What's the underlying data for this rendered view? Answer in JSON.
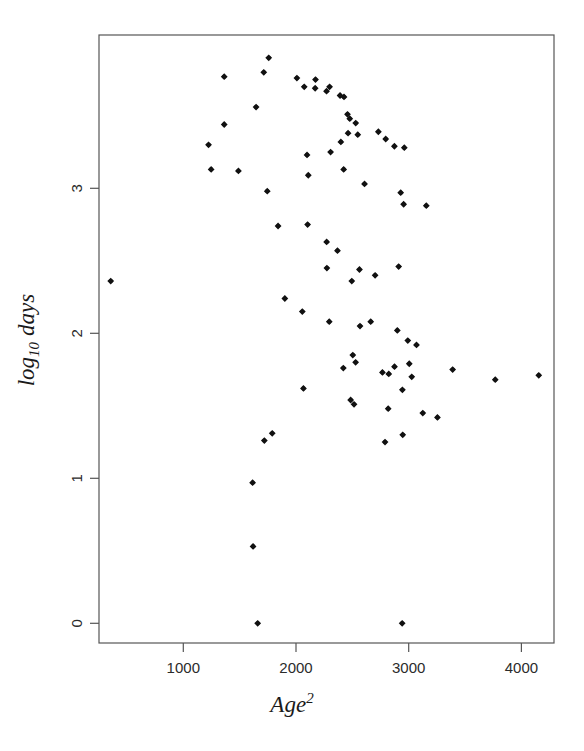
{
  "chart_data": {
    "type": "scatter",
    "title": "",
    "xlabel": "Age^2",
    "ylabel": "log10 days",
    "xlabel_parts": {
      "base": "Age",
      "exponent": "2"
    },
    "ylabel_parts": {
      "base": "log",
      "subscript": "10",
      "tail": "days"
    },
    "xlim": [
      310,
      4230
    ],
    "ylim": [
      -0.17,
      3.72
    ],
    "xticks": [
      1000,
      2000,
      3000,
      4000
    ],
    "xtick_labels": [
      "1000",
      "2000",
      "3000",
      "4000"
    ],
    "yticks": [
      0,
      1,
      2,
      3
    ],
    "ytick_labels": [
      "0",
      "1",
      "2",
      "3"
    ],
    "grid": false,
    "legend": false,
    "marker": "filled-diamond",
    "marker_color": "#111111",
    "frame_color": "#555555",
    "background": "#ffffff",
    "n_points": 79,
    "x": [
      1363,
      1758,
      1714,
      2008,
      2173,
      2298,
      1363,
      1224,
      1489,
      1745,
      1247,
      1646,
      2073,
      2170,
      2271,
      2391,
      2426,
      2457,
      2477,
      2530,
      2462,
      2548,
      2398,
      2307,
      2098,
      2873,
      2731,
      2796,
      2961,
      2608,
      2423,
      2109,
      2929,
      2955,
      3156,
      2103,
      1841,
      2272,
      2368,
      2274,
      2911,
      2563,
      2702,
      2495,
      1901,
      2056,
      2295,
      2568,
      2663,
      2899,
      2992,
      3069,
      2504,
      2529,
      3390,
      3768,
      4154,
      2874,
      3005,
      2420,
      2767,
      2823,
      3027,
      2944,
      2818,
      3125,
      3255,
      2947,
      2790,
      2066,
      2485,
      2515,
      1789,
      1719,
      1615,
      1619,
      1660,
      2942,
      356
    ],
    "y": [
      3.77,
      3.9,
      3.8,
      3.76,
      3.75,
      3.7,
      3.44,
      3.3,
      3.12,
      2.98,
      3.13,
      3.56,
      3.7,
      3.69,
      3.67,
      3.64,
      3.63,
      3.51,
      3.48,
      3.45,
      3.38,
      3.37,
      3.32,
      3.25,
      3.23,
      3.29,
      3.39,
      3.34,
      3.28,
      3.03,
      3.13,
      3.09,
      2.97,
      2.89,
      2.88,
      2.75,
      2.74,
      2.63,
      2.57,
      2.45,
      2.46,
      2.44,
      2.4,
      2.36,
      2.24,
      2.15,
      2.08,
      2.05,
      2.08,
      2.02,
      1.95,
      1.92,
      1.85,
      1.8,
      1.75,
      1.68,
      1.71,
      1.77,
      1.79,
      1.76,
      1.73,
      1.72,
      1.7,
      1.61,
      1.48,
      1.45,
      1.42,
      1.3,
      1.25,
      1.62,
      1.54,
      1.51,
      1.31,
      1.26,
      0.97,
      0.53,
      0.0,
      0.0,
      2.36
    ],
    "points": [
      {
        "x": 1363,
        "y": 3.77
      },
      {
        "x": 1758,
        "y": 3.9
      },
      {
        "x": 1714,
        "y": 3.8
      },
      {
        "x": 2008,
        "y": 3.76
      },
      {
        "x": 2173,
        "y": 3.75
      },
      {
        "x": 2298,
        "y": 3.7
      },
      {
        "x": 1363,
        "y": 3.44
      },
      {
        "x": 1224,
        "y": 3.3
      },
      {
        "x": 1489,
        "y": 3.12
      },
      {
        "x": 1745,
        "y": 2.98
      },
      {
        "x": 1247,
        "y": 3.13
      },
      {
        "x": 1646,
        "y": 3.56
      },
      {
        "x": 2073,
        "y": 3.7
      },
      {
        "x": 2170,
        "y": 3.69
      },
      {
        "x": 2271,
        "y": 3.67
      },
      {
        "x": 2391,
        "y": 3.64
      },
      {
        "x": 2426,
        "y": 3.63
      },
      {
        "x": 2457,
        "y": 3.51
      },
      {
        "x": 2477,
        "y": 3.48
      },
      {
        "x": 2530,
        "y": 3.45
      },
      {
        "x": 2462,
        "y": 3.38
      },
      {
        "x": 2548,
        "y": 3.37
      },
      {
        "x": 2398,
        "y": 3.32
      },
      {
        "x": 2307,
        "y": 3.25
      },
      {
        "x": 2098,
        "y": 3.23
      },
      {
        "x": 2873,
        "y": 3.29
      },
      {
        "x": 2731,
        "y": 3.39
      },
      {
        "x": 2796,
        "y": 3.34
      },
      {
        "x": 2961,
        "y": 3.28
      },
      {
        "x": 2608,
        "y": 3.03
      },
      {
        "x": 2423,
        "y": 3.13
      },
      {
        "x": 2109,
        "y": 3.09
      },
      {
        "x": 2929,
        "y": 2.97
      },
      {
        "x": 2955,
        "y": 2.89
      },
      {
        "x": 3156,
        "y": 2.88
      },
      {
        "x": 2103,
        "y": 2.75
      },
      {
        "x": 1841,
        "y": 2.74
      },
      {
        "x": 2272,
        "y": 2.63
      },
      {
        "x": 2368,
        "y": 2.57
      },
      {
        "x": 2274,
        "y": 2.45
      },
      {
        "x": 2911,
        "y": 2.46
      },
      {
        "x": 2563,
        "y": 2.44
      },
      {
        "x": 2702,
        "y": 2.4
      },
      {
        "x": 2495,
        "y": 2.36
      },
      {
        "x": 1901,
        "y": 2.24
      },
      {
        "x": 2056,
        "y": 2.15
      },
      {
        "x": 2295,
        "y": 2.08
      },
      {
        "x": 2568,
        "y": 2.05
      },
      {
        "x": 2663,
        "y": 2.08
      },
      {
        "x": 2899,
        "y": 2.02
      },
      {
        "x": 2992,
        "y": 1.95
      },
      {
        "x": 3069,
        "y": 1.92
      },
      {
        "x": 2504,
        "y": 1.85
      },
      {
        "x": 2529,
        "y": 1.8
      },
      {
        "x": 3390,
        "y": 1.75
      },
      {
        "x": 3768,
        "y": 1.68
      },
      {
        "x": 4154,
        "y": 1.71
      },
      {
        "x": 2874,
        "y": 1.77
      },
      {
        "x": 3005,
        "y": 1.79
      },
      {
        "x": 2420,
        "y": 1.76
      },
      {
        "x": 2767,
        "y": 1.73
      },
      {
        "x": 2823,
        "y": 1.72
      },
      {
        "x": 3027,
        "y": 1.7
      },
      {
        "x": 2944,
        "y": 1.61
      },
      {
        "x": 2818,
        "y": 1.48
      },
      {
        "x": 3125,
        "y": 1.45
      },
      {
        "x": 3255,
        "y": 1.42
      },
      {
        "x": 2947,
        "y": 1.3
      },
      {
        "x": 2790,
        "y": 1.25
      },
      {
        "x": 2066,
        "y": 1.62
      },
      {
        "x": 2485,
        "y": 1.54
      },
      {
        "x": 2515,
        "y": 1.51
      },
      {
        "x": 1789,
        "y": 1.31
      },
      {
        "x": 1719,
        "y": 1.26
      },
      {
        "x": 1615,
        "y": 0.97
      },
      {
        "x": 1619,
        "y": 0.53
      },
      {
        "x": 1660,
        "y": 0.0
      },
      {
        "x": 2942,
        "y": 0.0
      },
      {
        "x": 356,
        "y": 2.36
      }
    ]
  }
}
